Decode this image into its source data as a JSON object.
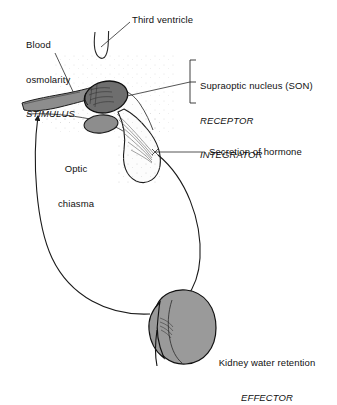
{
  "diagram": {
    "type": "biological-flow-diagram",
    "background_color": "#ffffff",
    "ink_color": "#1a1a1a"
  },
  "labels": {
    "stimulus": {
      "line1": "Blood",
      "line2": "osmolarity",
      "emphasis": "STIMULUS",
      "role": "STIMULUS"
    },
    "third_ventricle": {
      "text": "Third ventricle"
    },
    "son": {
      "line1": "Supraoptic nucleus (SON)",
      "emphasis1": "RECEPTOR",
      "emphasis2": "INTEGRATOR"
    },
    "optic_chiasma": {
      "line1": "Optic",
      "line2": "chiasma"
    },
    "secretion": {
      "text": "Secretion of hormone"
    },
    "kidney": {
      "line1": "Kidney water retention",
      "emphasis": "EFFECTOR"
    }
  },
  "structures": [
    {
      "name": "third-ventricle",
      "fill": "#ffffff",
      "stroke": "#2a2a2a"
    },
    {
      "name": "supraoptic-nucleus",
      "fill": "#6e6e6e",
      "stroke": "#1a1a1a"
    },
    {
      "name": "optic-tract",
      "fill": "#8d8d8d",
      "stroke": "#1a1a1a"
    },
    {
      "name": "optic-chiasma-body",
      "fill": "#8d8d8d",
      "stroke": "#1a1a1a"
    },
    {
      "name": "hypothalamus",
      "fill": "#fdfdfd",
      "stroke": "#2a2a2a"
    },
    {
      "name": "pituitary-gland",
      "fill": "#fcfcfc",
      "stroke": "#1a1a1a"
    },
    {
      "name": "kidney",
      "fill": "#9a9a9a",
      "stroke": "#1a1a1a"
    }
  ],
  "connectors": [
    {
      "name": "stimulus-leader",
      "style": "straight-line"
    },
    {
      "name": "third-ventricle-leader",
      "style": "straight-line"
    },
    {
      "name": "son-bracket",
      "style": "bracket"
    },
    {
      "name": "son-leader",
      "style": "straight-line"
    },
    {
      "name": "secretion-leader",
      "style": "straight-line"
    },
    {
      "name": "hormone-transport-arrow",
      "style": "curved-arrow",
      "direction": "pituitary-to-kidney"
    },
    {
      "name": "feedback-arrow",
      "style": "curved-arrow",
      "direction": "kidney-to-hypothalamus"
    }
  ]
}
